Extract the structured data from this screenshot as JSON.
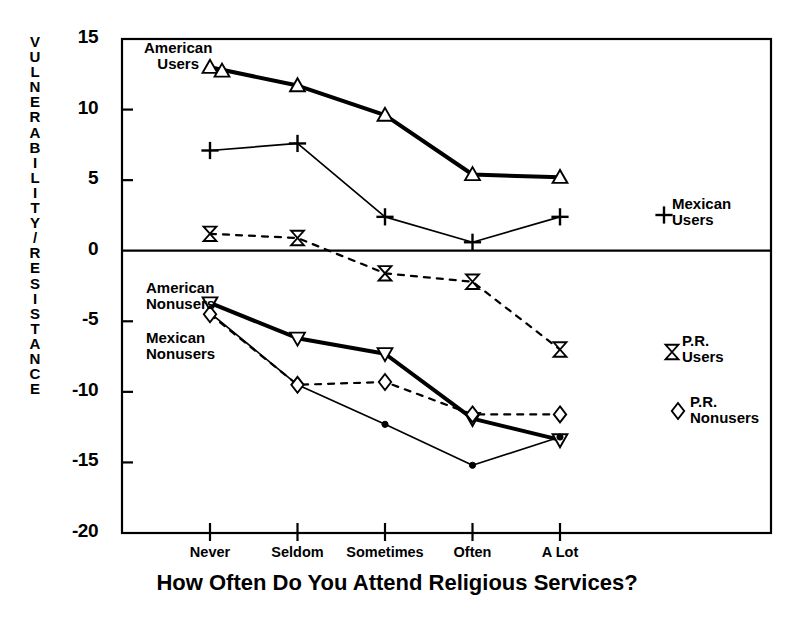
{
  "chart_data": {
    "type": "line",
    "title": "",
    "xlabel": "How Often Do You Attend Religious Services?",
    "ylabel": "VULNERABILITY/RESISTANCE",
    "categories": [
      "Never",
      "Seldom",
      "Sometimes",
      "Often",
      "A Lot"
    ],
    "yticks": [
      "15",
      "10",
      "5",
      "0",
      "-5",
      "-10",
      "-15",
      "-20"
    ],
    "ylim": [
      -20,
      15
    ],
    "grid": false,
    "zero_line": true,
    "legend_position": "inline-annotations",
    "series": [
      {
        "name": "American Users",
        "marker": "triangle-up",
        "line": "solid-thick",
        "values": [
          13.0,
          11.7,
          9.6,
          5.4,
          5.2
        ],
        "label": "American\nUsers",
        "label_side": "left"
      },
      {
        "name": "Mexican Users",
        "marker": "plus",
        "line": "solid-thin",
        "values": [
          7.1,
          7.6,
          2.4,
          0.6,
          2.4
        ],
        "label": "Mexican\nUsers",
        "label_side": "right"
      },
      {
        "name": "P.R. Users",
        "marker": "bowtie",
        "line": "dashed",
        "values": [
          1.2,
          0.9,
          -1.6,
          -2.2,
          -7.0
        ],
        "label": "P.R.\nUsers",
        "label_side": "right"
      },
      {
        "name": "American Nonusers",
        "marker": "triangle-down",
        "line": "solid-thick",
        "values": [
          -3.7,
          -6.2,
          -7.3,
          -11.9,
          -13.4
        ],
        "label": "American\nNonusers",
        "label_side": "left"
      },
      {
        "name": "Mexican Nonusers",
        "marker": "dot",
        "line": "solid-thin",
        "values": [
          -4.4,
          -9.5,
          -12.3,
          -15.2,
          -13.2
        ],
        "label": "Mexican\nNonusers",
        "label_side": "left"
      },
      {
        "name": "P.R. Nonusers",
        "marker": "diamond",
        "line": "dashed",
        "values": [
          -4.5,
          -9.5,
          -9.3,
          -11.6,
          -11.6
        ],
        "label": "P.R.\nNonusers",
        "label_side": "right"
      }
    ]
  },
  "annotations": {
    "american_users": "American\nUsers",
    "mexican_users": "Mexican\nUsers",
    "pr_users": "P.R.\nUsers",
    "american_nonusers": "American\nNonusers",
    "mexican_nonusers": "Mexican\nNonusers",
    "pr_nonusers": "P.R.\nNonusers"
  },
  "colors": {
    "ink": "#000000",
    "background": "#ffffff"
  }
}
